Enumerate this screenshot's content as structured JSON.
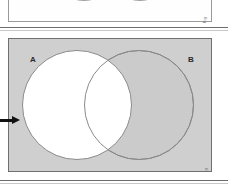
{
  "figure": {
    "type": "venn-diagram",
    "universe_label": "",
    "sets": [
      {
        "id": "A",
        "label": "A",
        "position": "left"
      },
      {
        "id": "B",
        "label": "B",
        "position": "right"
      }
    ],
    "shading": {
      "description": "Region outside A is shaded; set A including the intersection is unshaded (white)",
      "shaded_regions": [
        "B-only",
        "outside-A-and-B"
      ],
      "unshaded_regions": [
        "A-only",
        "A-intersect-B"
      ],
      "shaded_color": "#cfcfcf",
      "unshaded_color": "#ffffff",
      "outline_color": "#8a8a8a"
    },
    "annotation": {
      "arrow": "pointer-arrow-left",
      "arrow_direction": "right"
    },
    "corner_tag": "Fig",
    "corner_tag_top": "Fig"
  },
  "top_panel": {
    "type": "venn-diagram",
    "state": "cropped",
    "sets": [
      {
        "id": "A",
        "label": ""
      },
      {
        "id": "B",
        "label": ""
      }
    ]
  },
  "colors": {
    "page_background": "#ffffff",
    "panel_fill": "#cfcfcf",
    "panel_border": "#6f6f6f",
    "separator": "#6d6d6d",
    "label_text": "#2a2a2a",
    "arrow": "#111111"
  }
}
